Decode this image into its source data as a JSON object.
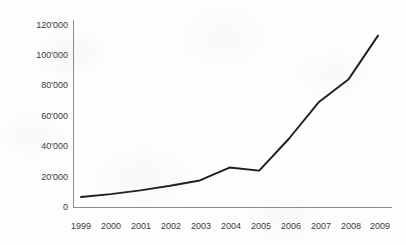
{
  "chart_data": {
    "type": "line",
    "title": "",
    "subtitle": "",
    "xlabel": "",
    "ylabel": "",
    "categories": [
      "1999",
      "2000",
      "2001",
      "2002",
      "2003",
      "2004",
      "2005",
      "2006",
      "2007",
      "2008",
      "2009"
    ],
    "series": [
      {
        "name": "",
        "values": [
          6600,
          8500,
          11000,
          14000,
          17500,
          26000,
          24000,
          45000,
          69000,
          84000,
          113000
        ]
      }
    ],
    "y_tick_labels": [
      "0",
      "20'000",
      "40'000",
      "60'000",
      "80'000",
      "100'000",
      "120'000"
    ],
    "y_tick_values": [
      0,
      20000,
      40000,
      60000,
      80000,
      100000,
      120000
    ],
    "ylim": [
      0,
      120000
    ],
    "grid": false,
    "legend": false,
    "legend_position": "none",
    "line_color": "#1d1d1d",
    "axis_color": "#8c8c8c",
    "background_color": "#fdfdfd",
    "annotations": []
  },
  "axes": {
    "y_axis_name": "value-axis",
    "x_axis_name": "year-axis"
  }
}
